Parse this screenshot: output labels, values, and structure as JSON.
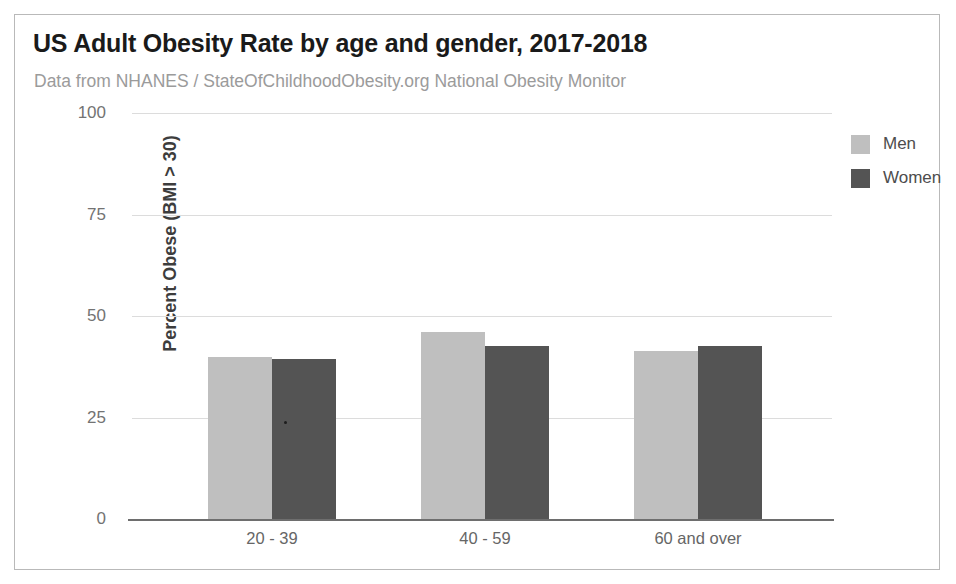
{
  "chart_data": {
    "type": "bar",
    "title": "US Adult Obesity Rate by age and gender, 2017-2018",
    "subtitle": "Data from NHANES / StateOfChildhoodObesity.org National Obesity Monitor",
    "xlabel": "",
    "ylabel": "Percent Obese (BMI > 30)",
    "ylim": [
      0,
      100
    ],
    "yticks": [
      0,
      25,
      50,
      75,
      100
    ],
    "ytick_labels": [
      "0",
      "25",
      "50",
      "75",
      "100"
    ],
    "grid": true,
    "legend_position": "right",
    "categories": [
      "20 - 39",
      "40 - 59",
      "60 and over"
    ],
    "series": [
      {
        "name": "Men",
        "color": "#bfbfbf",
        "values": [
          40,
          46,
          41.5
        ]
      },
      {
        "name": "Women",
        "color": "#545454",
        "values": [
          39.5,
          42.5,
          42.5
        ]
      }
    ]
  },
  "card": {
    "border_color": "#b9b9b9",
    "background": "#ffffff"
  },
  "axis": {
    "line_color": "#6e6e6e",
    "grid_color": "#dcdcdc",
    "tick_label_color": "#737373",
    "title_color": "#3d3d3d"
  }
}
